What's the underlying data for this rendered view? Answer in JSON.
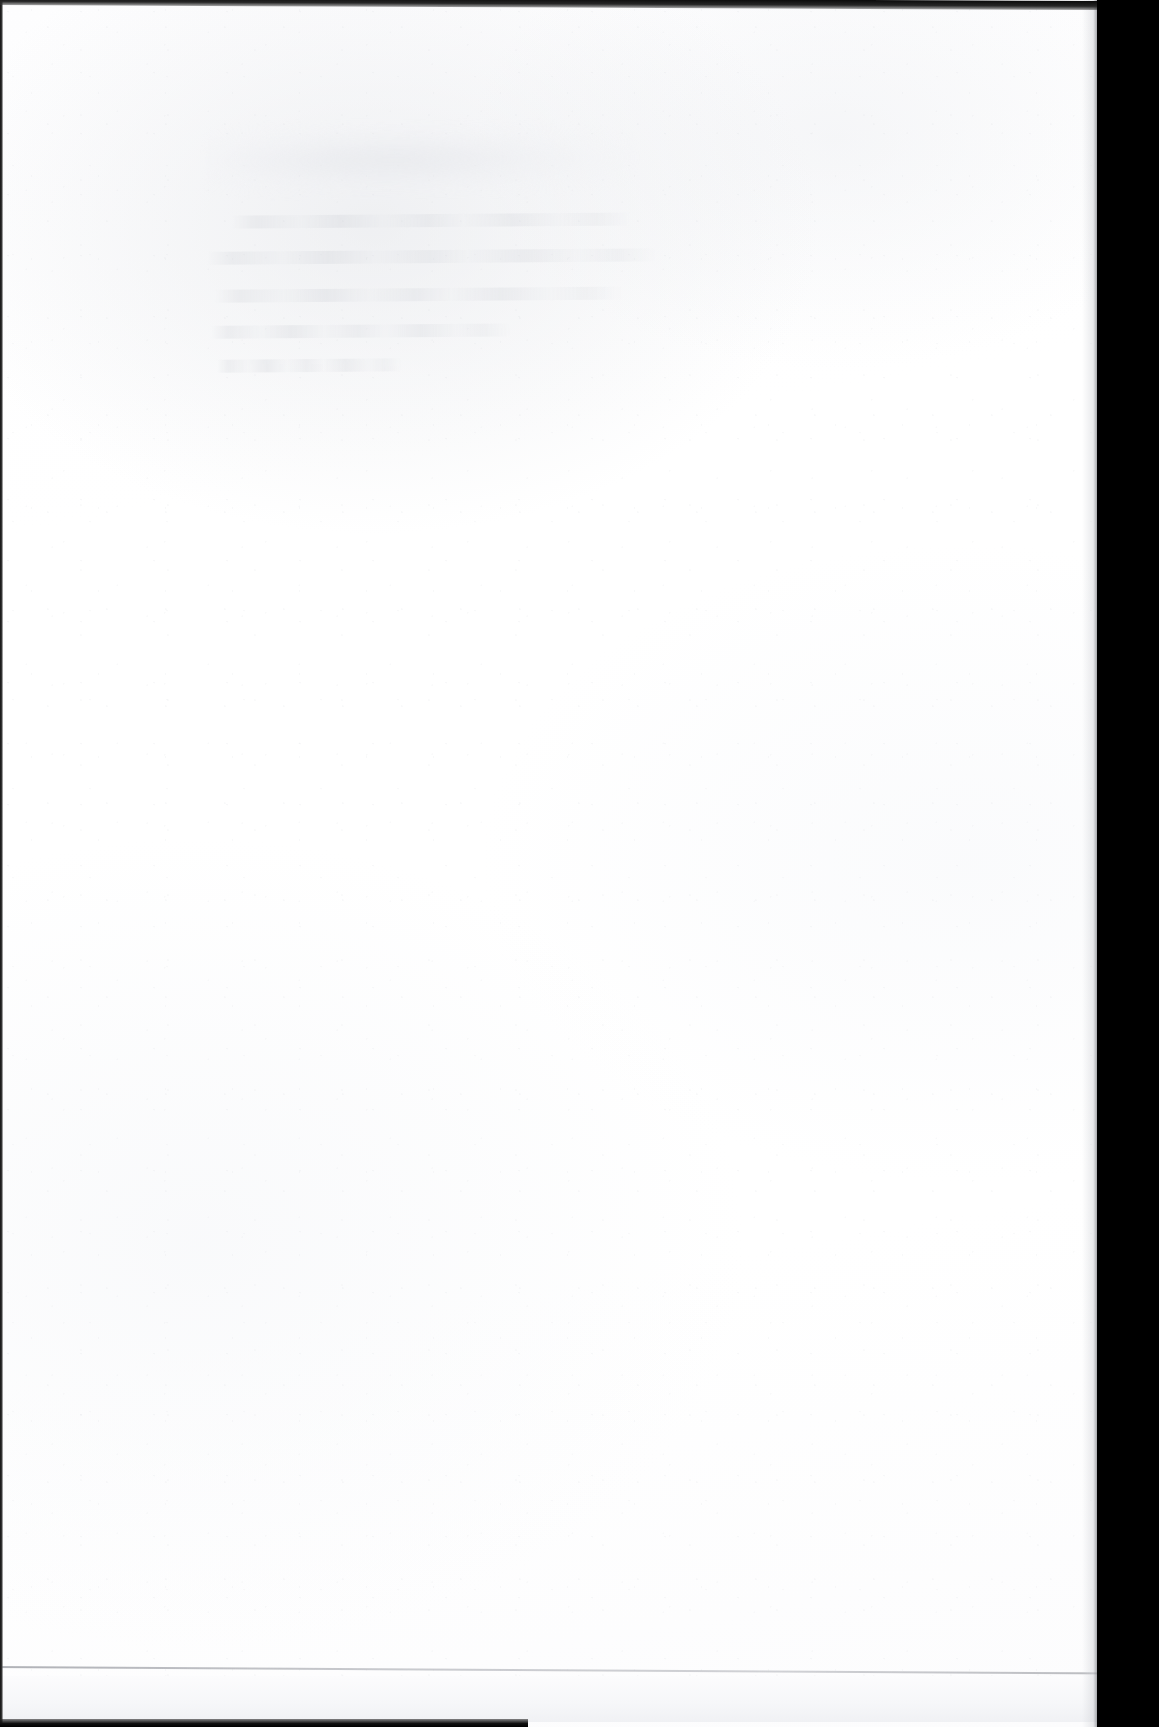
{
  "document": {
    "kind": "scanned-page",
    "content_state": "blank",
    "page_text": "",
    "visible_text_items": [],
    "notes_visible_on_page": "No legible printed text is present on this page."
  },
  "canvas": {
    "width_px": 1159,
    "height_px": 1727
  },
  "paper": {
    "label": "paper-surface",
    "color": "#ffffff",
    "tint_highlight": "#fdfdfe",
    "tint_shadow": "#f6f7f9",
    "left_px": 0,
    "top_px": 0,
    "width_px": 1099,
    "height_px": 1727
  },
  "bleed_through": {
    "label": "show-through-ghost-text",
    "description": "Faint mirrored text bleeding through from the reverse side of the sheet; illegible.",
    "legible": false,
    "color": "#cdd0d6",
    "opacity": 0.4,
    "region": {
      "left_px": 196,
      "top_px": 118,
      "width_px": 492,
      "height_px": 262
    },
    "rotation_deg": -0.45,
    "bands": [
      {
        "left_px": 10,
        "top_px": 4,
        "width_px": 430,
        "height_px": 74
      },
      {
        "left_px": 44,
        "top_px": 16,
        "width_px": 330,
        "height_px": 52
      }
    ],
    "lines": [
      {
        "left_px": 36,
        "top_px": 96,
        "width_px": 400
      },
      {
        "left_px": 10,
        "top_px": 132,
        "width_px": 452
      },
      {
        "left_px": 18,
        "top_px": 170,
        "width_px": 408
      },
      {
        "left_px": 14,
        "top_px": 206,
        "width_px": 300
      },
      {
        "left_px": 20,
        "top_px": 240,
        "width_px": 184
      }
    ]
  },
  "bottom_rule": {
    "label": "page-bottom-rule",
    "color": "#9ea0a6",
    "left_px": -10,
    "top_px": 1666,
    "width_px": 1125,
    "height_px": 2,
    "rotation_deg": 0.33
  },
  "scanner_void": {
    "label": "scanner-void-right",
    "color": "#000000",
    "left_px": 1097,
    "top_px": 0,
    "width_px": 62,
    "height_px": 1727
  },
  "edges": {
    "top": {
      "label": "page-edge-top",
      "color": "#1a1a1a",
      "top_px": -4,
      "height_px": 9,
      "rotation_deg": 0.26
    },
    "left": {
      "label": "page-edge-left",
      "color": "#202020",
      "left_px": 0,
      "width_px": 3
    },
    "bottom": {
      "label": "page-edge-bottom",
      "color": "#111111",
      "top_px": 1719,
      "width_px": 528,
      "height_px": 8
    }
  }
}
